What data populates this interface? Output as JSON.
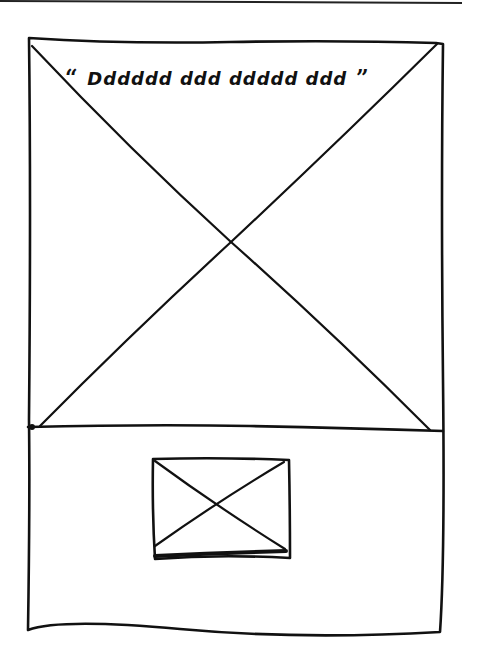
{
  "wireframe": {
    "type": "hand-drawn page layout sketch",
    "stroke_color": "#111111",
    "background": "#ffffff",
    "outer_frame": {
      "label": "page frame"
    },
    "hero_section": {
      "label": "large image placeholder",
      "quote": {
        "open_mark": "“",
        "text": "Dddddd ddd ddddd ddd",
        "close_mark": "”",
        "note": "handwritten squiggle placeholder text"
      }
    },
    "divider": {
      "label": "section divider"
    },
    "lower_section": {
      "label": "lower section",
      "thumbnail": {
        "label": "small image placeholder"
      }
    }
  }
}
